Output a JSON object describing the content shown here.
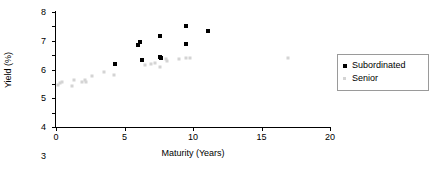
{
  "chart_data": {
    "type": "scatter",
    "title": "",
    "xlabel": "Maturity (Years)",
    "ylabel": "Yield (%)",
    "xlim": [
      0,
      20
    ],
    "ylim": [
      0,
      8
    ],
    "xticks": [
      0,
      5,
      10,
      15,
      20
    ],
    "yticks": [
      0,
      1,
      2,
      3,
      4,
      5,
      6,
      7,
      8
    ],
    "grid": false,
    "legend_position": "right",
    "series": [
      {
        "name": "Subordinated",
        "color": "#000000",
        "marker": "square",
        "points": [
          {
            "x": 4.3,
            "y": 4.35
          },
          {
            "x": 6.0,
            "y": 5.7
          },
          {
            "x": 6.1,
            "y": 5.9
          },
          {
            "x": 6.3,
            "y": 4.65
          },
          {
            "x": 7.6,
            "y": 6.3
          },
          {
            "x": 7.6,
            "y": 4.85
          },
          {
            "x": 7.7,
            "y": 4.8
          },
          {
            "x": 9.5,
            "y": 7.0
          },
          {
            "x": 9.5,
            "y": 5.8
          },
          {
            "x": 11.1,
            "y": 6.65
          }
        ]
      },
      {
        "name": "Senior",
        "color": "#d4d4d4",
        "marker": "square",
        "points": [
          {
            "x": 0.15,
            "y": 2.9
          },
          {
            "x": 0.3,
            "y": 3.05
          },
          {
            "x": 0.45,
            "y": 3.1
          },
          {
            "x": 1.2,
            "y": 2.85
          },
          {
            "x": 1.3,
            "y": 3.3
          },
          {
            "x": 1.9,
            "y": 3.15
          },
          {
            "x": 2.1,
            "y": 3.25
          },
          {
            "x": 2.2,
            "y": 3.1
          },
          {
            "x": 2.6,
            "y": 3.55
          },
          {
            "x": 3.5,
            "y": 3.85
          },
          {
            "x": 4.2,
            "y": 3.6
          },
          {
            "x": 6.5,
            "y": 4.3
          },
          {
            "x": 6.9,
            "y": 4.4
          },
          {
            "x": 7.2,
            "y": 4.45
          },
          {
            "x": 7.6,
            "y": 4.2
          },
          {
            "x": 8.0,
            "y": 4.75
          },
          {
            "x": 8.1,
            "y": 4.6
          },
          {
            "x": 9.0,
            "y": 4.75
          },
          {
            "x": 9.5,
            "y": 4.8
          },
          {
            "x": 9.8,
            "y": 4.8
          },
          {
            "x": 16.9,
            "y": 4.8
          }
        ]
      }
    ]
  },
  "legend": {
    "items": [
      {
        "label": "Subordinated",
        "color": "#000000"
      },
      {
        "label": "Senior",
        "color": "#d4d4d4"
      }
    ]
  }
}
